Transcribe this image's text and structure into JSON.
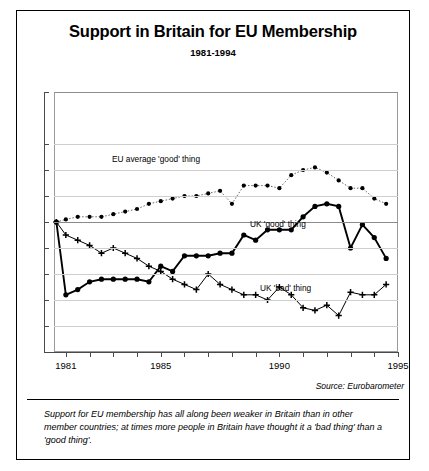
{
  "title": "Support in Britain for EU Membership",
  "subtitle": "1981-1994",
  "source": "Source: Eurobarometer",
  "caption": "Support for EU membership has all along been weaker in Britain than in other member countries; at times more people in Britain have thought it a 'bad thing' than a 'good thing'.",
  "annotations": {
    "eu": "EU average 'good' thing",
    "uk_good": "UK 'good' thing",
    "uk_bad": "UK 'bad' thing"
  },
  "axis": {
    "y_ticks": [
      "100%",
      "80%",
      "70%",
      "60%",
      "50%",
      "40%",
      "30%",
      "20%",
      "10%",
      "0"
    ],
    "x_ticks": [
      "1981",
      "1985",
      "1990",
      "1995"
    ]
  },
  "chart_data": {
    "type": "line",
    "title": "Support in Britain for EU Membership",
    "subtitle": "1981-1994",
    "xlabel": "",
    "ylabel": "",
    "xlim": [
      1980.5,
      1995
    ],
    "ylim": [
      0,
      100
    ],
    "ytick_values": [
      100,
      80,
      70,
      60,
      50,
      40,
      30,
      20,
      10,
      0
    ],
    "xtick_values": [
      1981,
      1985,
      1990,
      1995
    ],
    "grid": true,
    "reference_line": 50,
    "legend": "inline-annotations",
    "series": [
      {
        "name": "EU average 'good' thing",
        "marker": "filled-circle",
        "line": "dotted-thin",
        "x": [
          1980.6,
          1981.0,
          1981.5,
          1982.0,
          1982.5,
          1983.0,
          1983.5,
          1984.0,
          1984.5,
          1985.0,
          1985.5,
          1986.0,
          1986.5,
          1987.0,
          1987.5,
          1988.0,
          1988.5,
          1989.0,
          1989.5,
          1990.0,
          1990.5,
          1991.0,
          1991.5,
          1992.0,
          1992.5,
          1993.0,
          1993.5,
          1994.0,
          1994.5
        ],
        "values": [
          50,
          51,
          52,
          52,
          52,
          53,
          54,
          55,
          57,
          58,
          59,
          60,
          60,
          61,
          62,
          57,
          64,
          64,
          64,
          63,
          68,
          70,
          71,
          69,
          66,
          63,
          63,
          59,
          57
        ]
      },
      {
        "name": "UK 'good' thing",
        "marker": "filled-circle",
        "line": "solid-thick",
        "x": [
          1980.6,
          1981.0,
          1981.5,
          1982.0,
          1982.5,
          1983.0,
          1983.5,
          1984.0,
          1984.5,
          1985.0,
          1985.5,
          1986.0,
          1986.5,
          1987.0,
          1987.5,
          1988.0,
          1988.5,
          1989.0,
          1989.5,
          1990.0,
          1990.5,
          1991.0,
          1991.5,
          1992.0,
          1992.5,
          1993.0,
          1993.5,
          1994.0,
          1994.5
        ],
        "values": [
          50,
          22,
          24,
          27,
          28,
          28,
          28,
          28,
          27,
          33,
          31,
          37,
          37,
          37,
          38,
          38,
          45,
          43,
          47,
          47,
          47,
          52,
          56,
          57,
          56,
          40,
          49,
          44,
          36
        ]
      },
      {
        "name": "UK 'bad' thing",
        "marker": "plus",
        "line": "solid-thin",
        "x": [
          1980.6,
          1981.0,
          1981.5,
          1982.0,
          1982.5,
          1983.0,
          1983.5,
          1984.0,
          1984.5,
          1985.0,
          1985.5,
          1986.0,
          1986.5,
          1987.0,
          1987.5,
          1988.0,
          1988.5,
          1989.0,
          1989.5,
          1990.0,
          1990.5,
          1991.0,
          1991.5,
          1992.0,
          1992.5,
          1993.0,
          1993.5,
          1994.0,
          1994.5
        ],
        "values": [
          50,
          45,
          43,
          41,
          38,
          40,
          38,
          36,
          33,
          31,
          28,
          26,
          24,
          30,
          26,
          24,
          22,
          22,
          20,
          25,
          22,
          17,
          16,
          18,
          14,
          23,
          22,
          22,
          26
        ]
      }
    ]
  }
}
